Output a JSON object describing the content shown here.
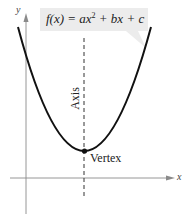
{
  "diagram": {
    "formula": {
      "prefix": "f(x) = ax",
      "exponent": "2",
      "suffix": " + bx + c"
    },
    "labels": {
      "y_axis": "y",
      "x_axis": "x",
      "axis_of_symmetry": "Axis",
      "vertex": "Vertex"
    },
    "colors": {
      "curve": "#111111",
      "axes": "#8a8a8a",
      "callout_bg": "#ececec",
      "text": "#222222"
    }
  }
}
